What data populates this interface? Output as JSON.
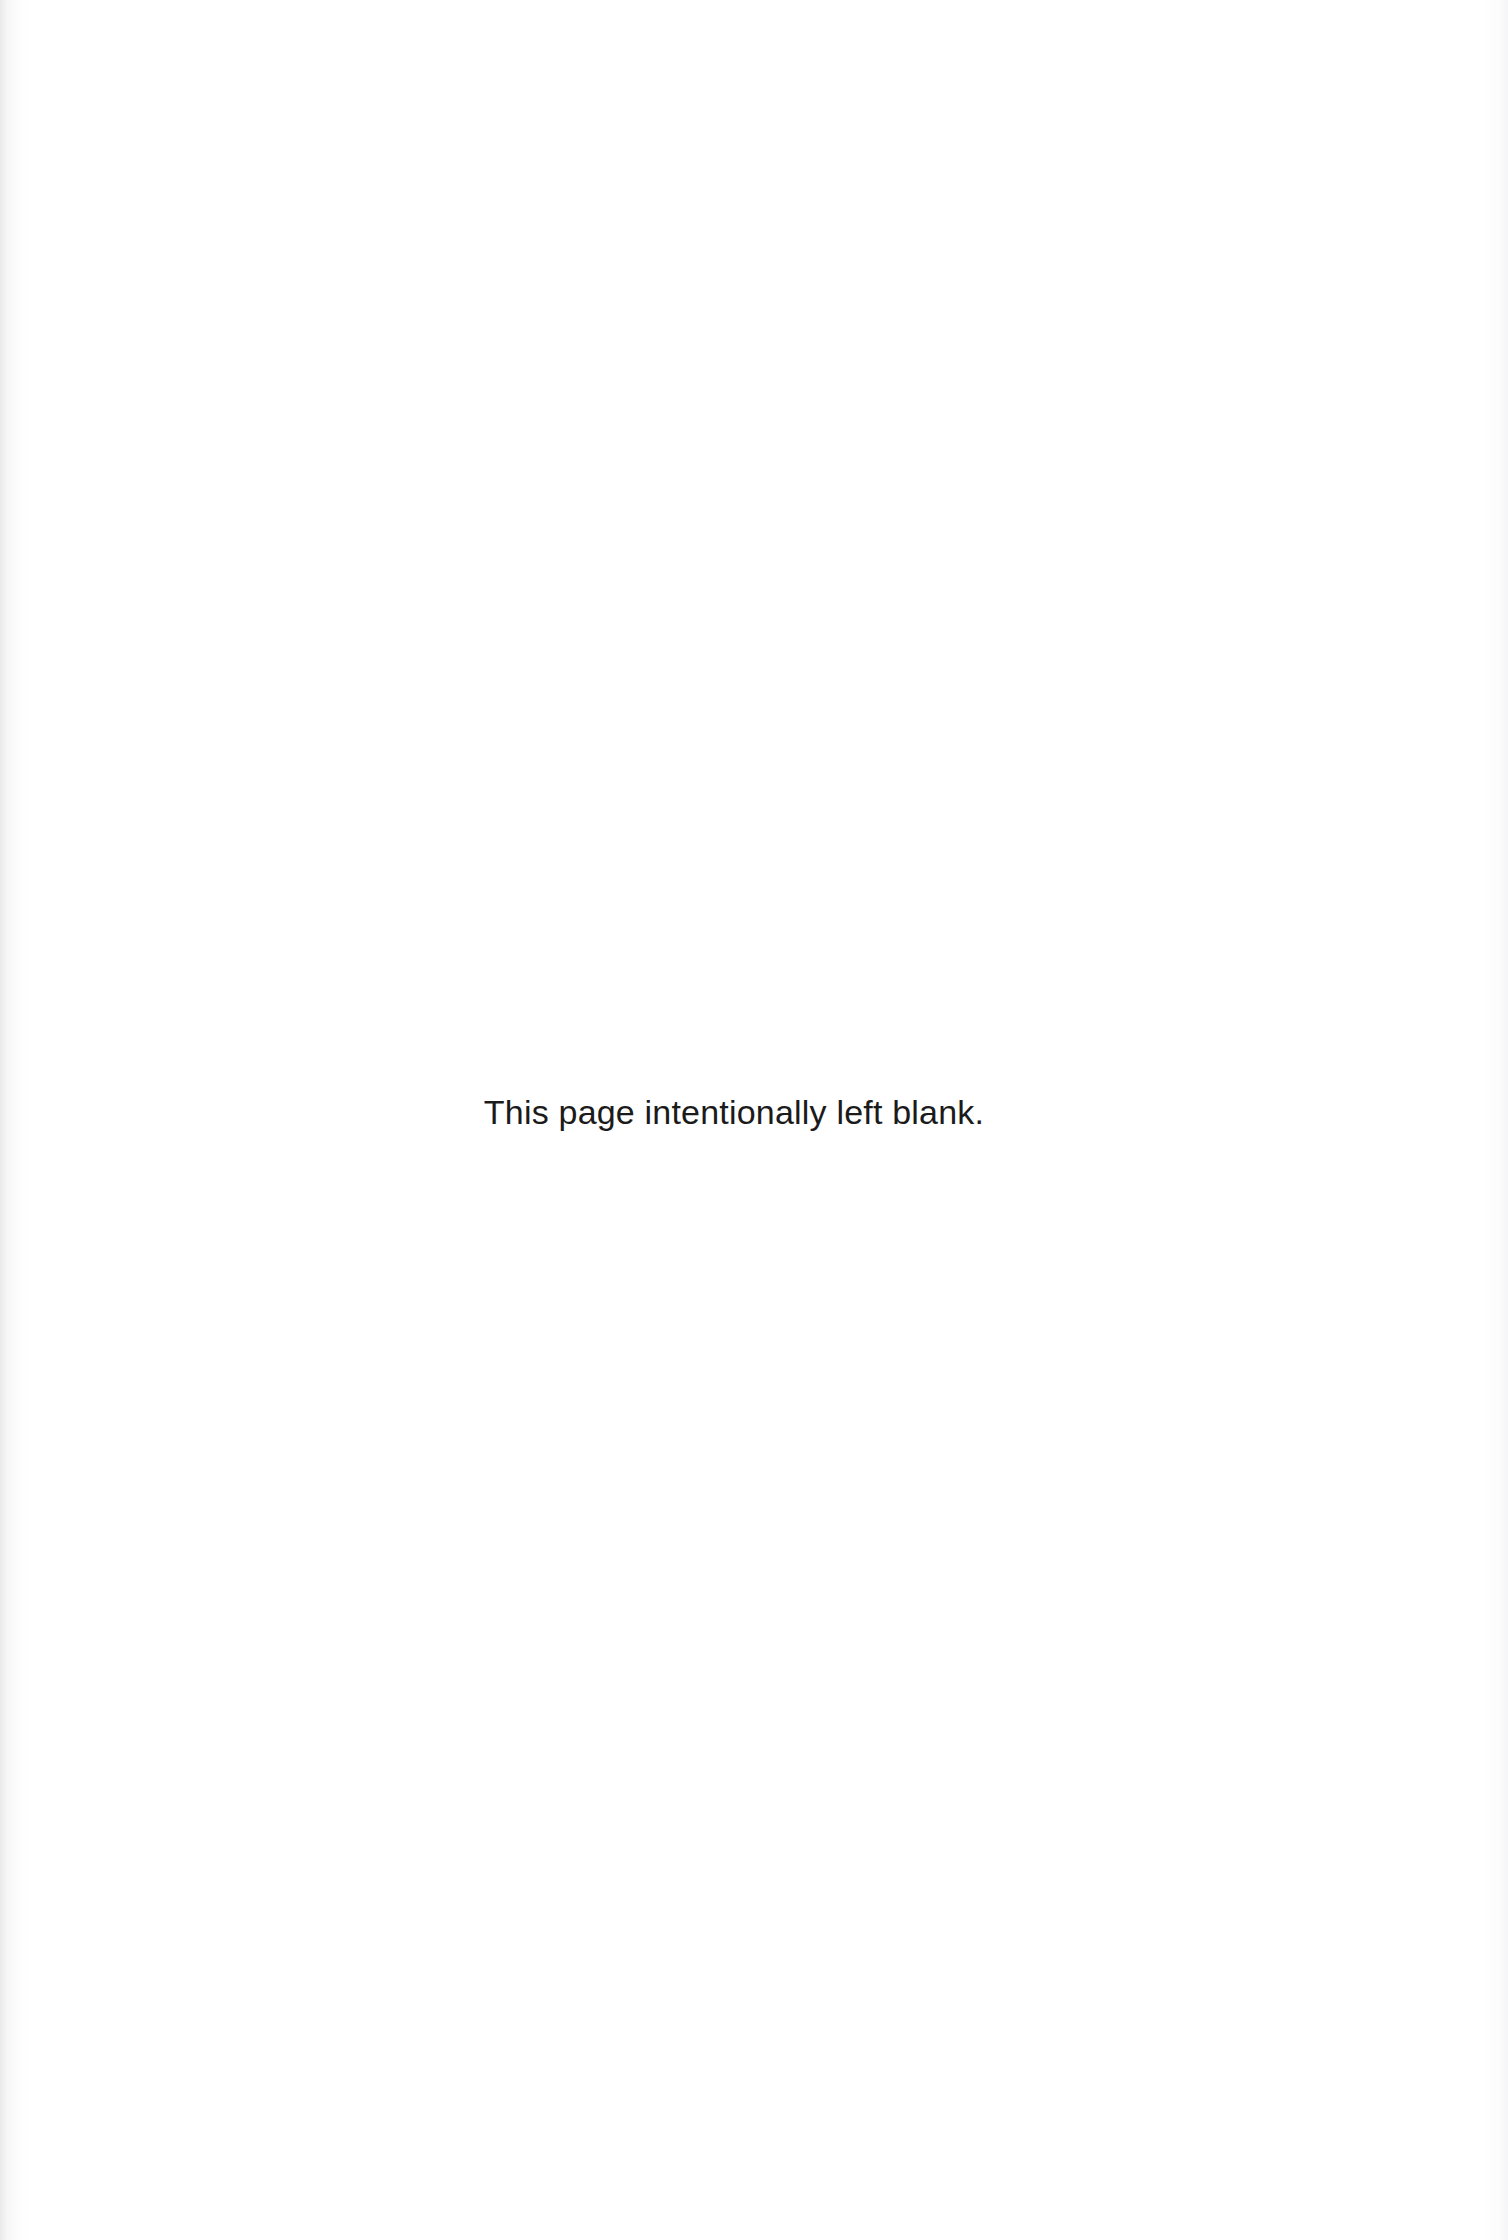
{
  "document": {
    "page_kind": "intentionally-blank-page",
    "background_color": "#ffffff",
    "text_color": "#1b1b1b"
  },
  "content": {
    "blank_notice": "This page intentionally left blank."
  }
}
